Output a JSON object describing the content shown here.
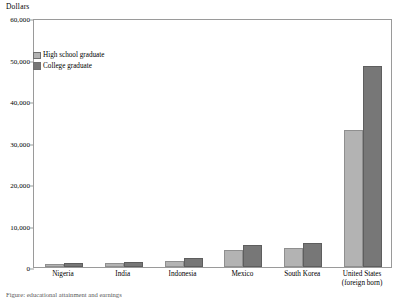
{
  "chart_data": {
    "type": "bar",
    "title": "",
    "ylabel": "Dollars",
    "xlabel": "",
    "ylim": [
      0,
      60000
    ],
    "ytick_labels": [
      "60,000",
      "50,000",
      "40,000",
      "30,000",
      "20,000",
      "10,000",
      "0"
    ],
    "ytick_values": [
      60000,
      50000,
      40000,
      30000,
      20000,
      10000,
      0
    ],
    "grid": false,
    "legend_position": "upper-left-inside",
    "categories": [
      "Nigeria",
      "India",
      "Indonesia",
      "Mexico",
      "South Korea",
      "United States (foreign born)"
    ],
    "category_labels": [
      {
        "line1": "Nigeria",
        "line2": ""
      },
      {
        "line1": "India",
        "line2": ""
      },
      {
        "line1": "Indonesia",
        "line2": ""
      },
      {
        "line1": "Mexico",
        "line2": ""
      },
      {
        "line1": "South Korea",
        "line2": ""
      },
      {
        "line1": "United States",
        "line2": "(foreign born)"
      }
    ],
    "series": [
      {
        "name": "High school graduate",
        "color": "#b3b3b3",
        "values": [
          800,
          900,
          1500,
          4000,
          4500,
          33000
        ]
      },
      {
        "name": "College graduate",
        "color": "#777777",
        "values": [
          900,
          1100,
          2100,
          5200,
          5800,
          48500
        ]
      }
    ]
  },
  "footnote": "Figure: educational attainment and earnings"
}
